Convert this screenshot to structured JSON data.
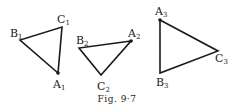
{
  "figure": {
    "caption": "Fig. 9·7",
    "triangles": [
      {
        "id": "triangle-1",
        "vertices": {
          "A": {
            "name": "A",
            "sub": "1",
            "x": 58,
            "y": 73,
            "dot": true
          },
          "B": {
            "name": "B",
            "sub": "1",
            "x": 20,
            "y": 40,
            "dot": false
          },
          "C": {
            "name": "C",
            "sub": "1",
            "x": 62,
            "y": 27,
            "dot": false
          }
        }
      },
      {
        "id": "triangle-2",
        "vertices": {
          "A": {
            "name": "A",
            "sub": "2",
            "x": 131,
            "y": 41,
            "dot": true
          },
          "B": {
            "name": "B",
            "sub": "2",
            "x": 79,
            "y": 48,
            "dot": false
          },
          "C": {
            "name": "C",
            "sub": "2",
            "x": 101,
            "y": 75,
            "dot": false
          }
        }
      },
      {
        "id": "triangle-3",
        "vertices": {
          "A": {
            "name": "A",
            "sub": "3",
            "x": 160,
            "y": 20,
            "dot": true
          },
          "B": {
            "name": "B",
            "sub": "3",
            "x": 160,
            "y": 73,
            "dot": false
          },
          "C": {
            "name": "C",
            "sub": "3",
            "x": 218,
            "y": 51,
            "dot": false
          }
        }
      }
    ]
  }
}
